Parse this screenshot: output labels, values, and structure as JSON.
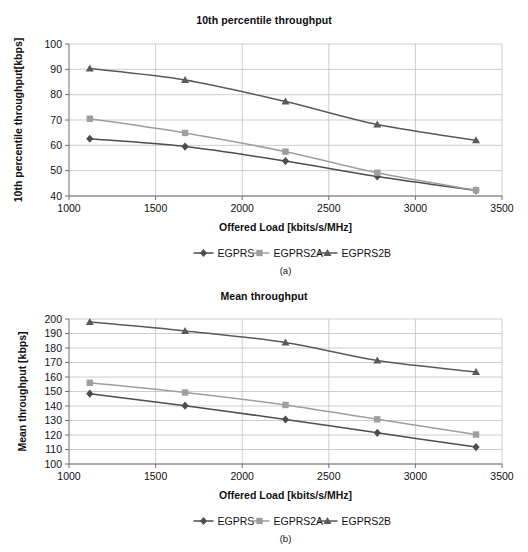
{
  "figure": {
    "background": "#ffffff",
    "series_colors": {
      "EGPRS": "#4d4d4d",
      "EGPRS2A": "#9e9e9e",
      "EGPRS2B": "#595959"
    },
    "grid_color": "#b8b8b8",
    "axis_color": "#6e6e6e"
  },
  "charts": [
    {
      "id": "chart-a",
      "caption": "(a)",
      "legend": [
        {
          "label": "EGPRS",
          "marker": "diamond",
          "color": "#4d4d4d"
        },
        {
          "label": "EGPRS2A",
          "marker": "square",
          "color": "#9e9e9e"
        },
        {
          "label": "EGPRS2B",
          "marker": "triangle",
          "color": "#595959"
        }
      ],
      "chart_data": {
        "type": "line",
        "title": "10th percentile throughput",
        "xlabel": "Offered Load [kbits/s/MHz]",
        "ylabel": "10th percentile throughput[kbps]",
        "xlim": [
          1000,
          3500
        ],
        "ylim": [
          40,
          100
        ],
        "xticks": [
          1000,
          1500,
          2000,
          2500,
          3000,
          3500
        ],
        "yticks": [
          40,
          50,
          60,
          70,
          80,
          90,
          100
        ],
        "grid": true,
        "legend_position": "bottom",
        "x": [
          1120,
          1670,
          2250,
          2780,
          3350
        ],
        "series": [
          {
            "name": "EGPRS",
            "marker": "diamond",
            "color": "#4d4d4d",
            "values": [
              62.6,
              59.5,
              53.8,
              47.7,
              42.2
            ]
          },
          {
            "name": "EGPRS2A",
            "marker": "square",
            "color": "#9e9e9e",
            "values": [
              70.5,
              64.9,
              57.5,
              49.2,
              42.3
            ]
          },
          {
            "name": "EGPRS2B",
            "marker": "triangle",
            "color": "#595959",
            "values": [
              90.3,
              85.8,
              77.3,
              68.2,
              62.0
            ]
          }
        ]
      }
    },
    {
      "id": "chart-b",
      "caption": "(b)",
      "legend": [
        {
          "label": "EGPRS",
          "marker": "diamond",
          "color": "#4d4d4d"
        },
        {
          "label": "EGPRS2A",
          "marker": "square",
          "color": "#9e9e9e"
        },
        {
          "label": "EGPRS2B",
          "marker": "triangle",
          "color": "#595959"
        }
      ],
      "chart_data": {
        "type": "line",
        "title": "Mean throughput",
        "xlabel": "Offered Load [kbits/s/MHz]",
        "ylabel": "Mean throughput [kbps]",
        "xlim": [
          1000,
          3500
        ],
        "ylim": [
          100,
          200
        ],
        "xticks": [
          1000,
          1500,
          2000,
          2500,
          3000,
          3500
        ],
        "yticks": [
          100,
          110,
          120,
          130,
          140,
          150,
          160,
          170,
          180,
          190,
          200
        ],
        "grid": true,
        "legend_position": "bottom",
        "x": [
          1120,
          1670,
          2250,
          2780,
          3350
        ],
        "series": [
          {
            "name": "EGPRS",
            "marker": "diamond",
            "color": "#4d4d4d",
            "values": [
              148.5,
              140.2,
              130.7,
              121.5,
              111.7
            ]
          },
          {
            "name": "EGPRS2A",
            "marker": "square",
            "color": "#9e9e9e",
            "values": [
              156.0,
              149.3,
              140.7,
              130.8,
              120.3
            ]
          },
          {
            "name": "EGPRS2B",
            "marker": "triangle",
            "color": "#595959",
            "values": [
              198.0,
              191.8,
              183.8,
              171.3,
              163.5
            ]
          }
        ]
      }
    }
  ]
}
